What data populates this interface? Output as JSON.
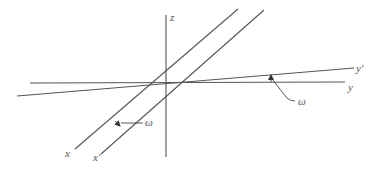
{
  "diagram": {
    "title": "",
    "origin": [
      166,
      83
    ],
    "axes": [
      {
        "id": "z",
        "label": "z",
        "from": [
          166,
          15
        ],
        "to": [
          166,
          157
        ]
      },
      {
        "id": "y",
        "label": "y",
        "from": [
          30,
          83
        ],
        "to": [
          345,
          82
        ]
      },
      {
        "id": "y_prime",
        "label": "y′",
        "from": [
          17,
          96
        ],
        "to": [
          354,
          68
        ]
      },
      {
        "id": "x",
        "label": "x",
        "from": [
          238,
          9
        ],
        "to": [
          75,
          149
        ]
      },
      {
        "id": "x_prime",
        "label": "x′",
        "from": [
          264,
          10
        ],
        "to": [
          101,
          154
        ]
      }
    ],
    "angle_annotations": [
      {
        "id": "omega_x",
        "label": "ω",
        "between": [
          "x",
          "x_prime"
        ]
      },
      {
        "id": "omega_y",
        "label": "ω",
        "between": [
          "y",
          "y_prime"
        ]
      }
    ],
    "colors": {
      "line": "#555555",
      "text": "#555555",
      "background": "#ffffff"
    }
  }
}
